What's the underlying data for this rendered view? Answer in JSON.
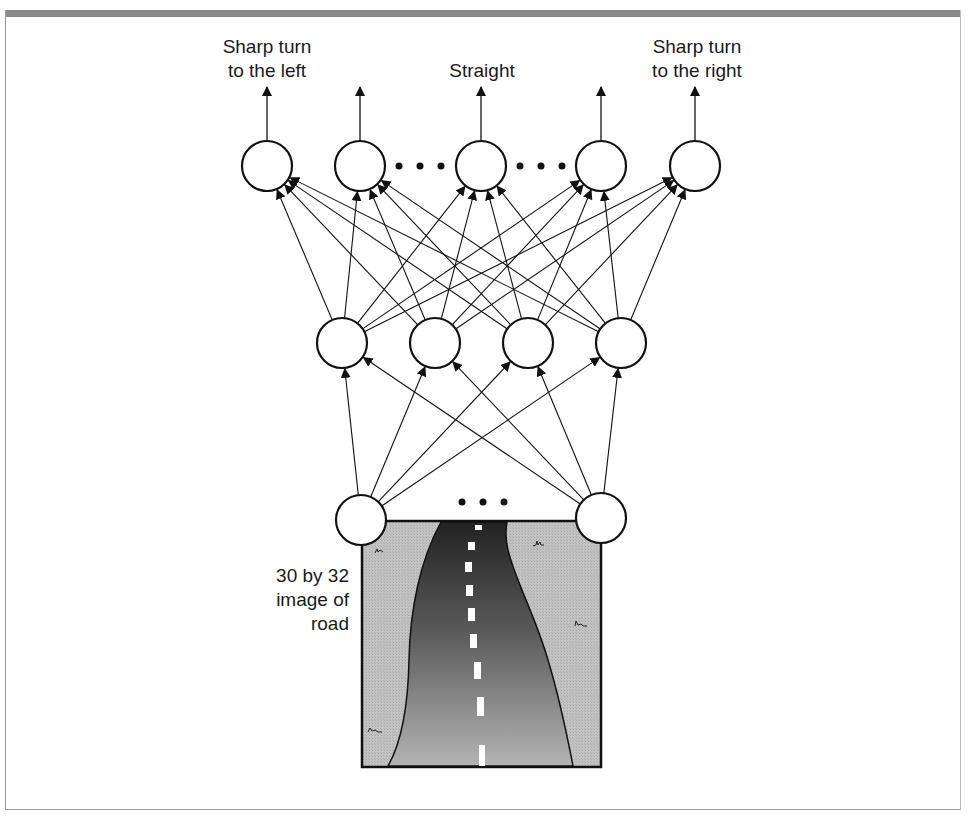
{
  "figure": {
    "output_labels": {
      "left": [
        "Sharp turn",
        "to the left"
      ],
      "center": [
        "Straight"
      ],
      "right": [
        "Sharp turn",
        "to the right"
      ]
    },
    "input_label": [
      "30 by 32",
      "image of",
      "road"
    ],
    "ellipsis": "• • •"
  },
  "network": {
    "output_nodes": [
      {
        "id": "out-1",
        "cx": 267,
        "cy": 166
      },
      {
        "id": "out-2",
        "cx": 360,
        "cy": 166
      },
      {
        "id": "out-3",
        "cx": 481,
        "cy": 166
      },
      {
        "id": "out-4",
        "cx": 601,
        "cy": 166
      },
      {
        "id": "out-5",
        "cx": 695,
        "cy": 166
      }
    ],
    "hidden_nodes": [
      {
        "id": "hid-1",
        "cx": 342,
        "cy": 343
      },
      {
        "id": "hid-2",
        "cx": 435,
        "cy": 343
      },
      {
        "id": "hid-3",
        "cx": 528,
        "cy": 343
      },
      {
        "id": "hid-4",
        "cx": 621,
        "cy": 343
      }
    ],
    "input_nodes": [
      {
        "id": "in-1",
        "cx": 361,
        "cy": 520
      },
      {
        "id": "in-2",
        "cx": 601,
        "cy": 518
      }
    ],
    "node_radius": 25,
    "colors": {
      "stroke": "#111111",
      "grass": "#bdbdbd",
      "road_top": "#2a2a2a",
      "road_bottom": "#a8a8a8",
      "frame_band": "#8a8a8a"
    }
  }
}
